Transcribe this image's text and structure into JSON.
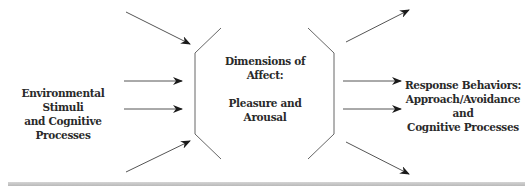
{
  "diagram": {
    "input_label": {
      "line1": "Environmental Stimuli",
      "line2": "and Cognitive Processes"
    },
    "center_label": {
      "line1": "Dimensions of",
      "line2": "Affect:",
      "line3": "Pleasure and",
      "line4": "Arousal"
    },
    "output_label": {
      "line1": "Response Behaviors:",
      "line2": "Approach/Avoidance and",
      "line3": "Cognitive Processes"
    },
    "colors": {
      "line": "#555555",
      "arrowhead": "#1a1a1a",
      "text": "#2a2a2a",
      "bottom_bar": "#c4c4c4"
    },
    "arrows_in_count": 4,
    "arrows_out_count": 4
  }
}
